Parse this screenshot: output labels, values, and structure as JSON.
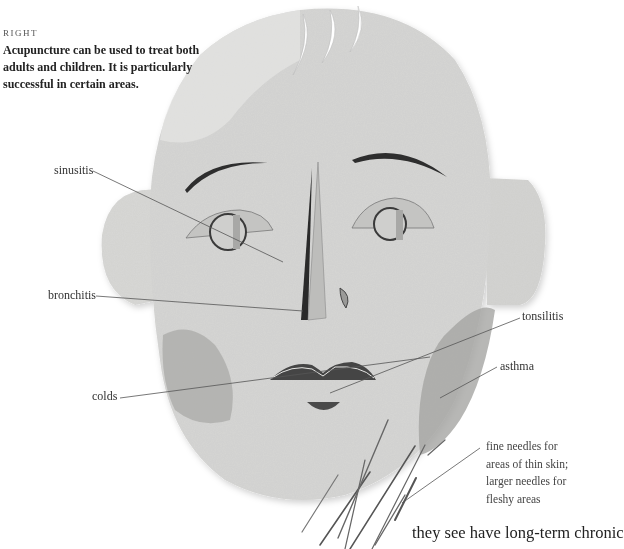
{
  "caption": {
    "kicker": "RIGHT",
    "text": "Acupuncture can be used to treat both adults and children. It is particularly successful in certain areas."
  },
  "labels": {
    "sinusitis": "sinusitis",
    "bronchitis": "bronchitis",
    "colds": "colds",
    "tonsilitis": "tonsilitis",
    "asthma": "asthma"
  },
  "needle_note": {
    "line1": "fine needles for",
    "line2": "areas of thin skin;",
    "line3": "larger needles for",
    "line4": "fleshy areas"
  },
  "footer_text": "they see have long-term chronic",
  "colors": {
    "paper": "#d6d6d4",
    "paper_dark": "#b3b3b1",
    "cut_dark": "#3a3a3a",
    "leader_line": "#555555"
  }
}
